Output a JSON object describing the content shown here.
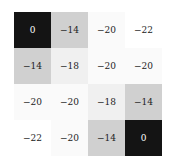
{
  "chart_data": {
    "type": "heatmap",
    "title": "",
    "xlabel": "",
    "ylabel": "",
    "rows": 4,
    "cols": 4,
    "values": [
      [
        0,
        -14,
        -20,
        -22
      ],
      [
        -14,
        -18,
        -20,
        -20
      ],
      [
        -20,
        -20,
        -18,
        -14
      ],
      [
        -22,
        -20,
        -14,
        0
      ]
    ],
    "labels": [
      [
        "0",
        "−14",
        "−20",
        "−22"
      ],
      [
        "−14",
        "−18",
        "−20",
        "−20"
      ],
      [
        "−20",
        "−20",
        "−18",
        "−14"
      ],
      [
        "−22",
        "−20",
        "−14",
        "0"
      ]
    ],
    "colormap": "greys",
    "vmin": -22,
    "vmax": 0,
    "grid": false,
    "legend": false
  }
}
